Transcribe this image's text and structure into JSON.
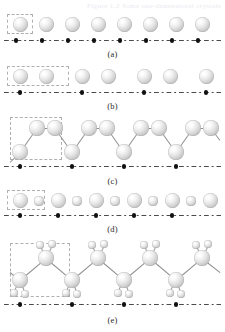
{
  "figure": {
    "cropped_header_text": "Figure 1.2  Some one-dimensional crystals",
    "background_color": "#ffffff",
    "atom_color": "#cfcfcf",
    "bond_color": "#8e8e8e",
    "lattice_line_color": "#4a4a4a",
    "lattice_point_color": "#111111",
    "unit_cell_border_color": "#b0b0b0",
    "width": 225,
    "height": 332
  },
  "panels": [
    {
      "id": "a",
      "label": "(a)",
      "description": "monatomic linear chain of identical spheres",
      "label_y": 49,
      "lattice_y": 40,
      "lattice_x0": 4,
      "lattice_x1": 221,
      "lattice_points_x": [
        16,
        42,
        68,
        94,
        120,
        146,
        172,
        198
      ],
      "unit_cell": {
        "x": 7,
        "y": 14,
        "w": 26,
        "h": 20
      },
      "atoms": [
        {
          "cx": 20,
          "cy": 24,
          "r": 7.5,
          "size": "large"
        },
        {
          "cx": 46,
          "cy": 24,
          "r": 7.5,
          "size": "large"
        },
        {
          "cx": 72,
          "cy": 24,
          "r": 7.5,
          "size": "large"
        },
        {
          "cx": 98,
          "cy": 24,
          "r": 7.5,
          "size": "large"
        },
        {
          "cx": 124,
          "cy": 24,
          "r": 7.5,
          "size": "large"
        },
        {
          "cx": 150,
          "cy": 24,
          "r": 7.5,
          "size": "large"
        },
        {
          "cx": 176,
          "cy": 24,
          "r": 7.5,
          "size": "large"
        },
        {
          "cx": 202,
          "cy": 24,
          "r": 7.5,
          "size": "large"
        }
      ],
      "bonds": []
    },
    {
      "id": "b",
      "label": "(b)",
      "description": "dimerized chain: pairs of spheres, lattice constant doubled",
      "label_y": 101,
      "lattice_y": 92,
      "lattice_x0": 4,
      "lattice_x1": 221,
      "lattice_points_x": [
        20,
        82,
        144,
        206
      ],
      "unit_cell": {
        "x": 7,
        "y": 66,
        "w": 62,
        "h": 20
      },
      "atoms": [
        {
          "cx": 20,
          "cy": 76,
          "r": 7.5,
          "size": "large"
        },
        {
          "cx": 46,
          "cy": 76,
          "r": 7.5,
          "size": "large"
        },
        {
          "cx": 82,
          "cy": 76,
          "r": 7.5,
          "size": "large"
        },
        {
          "cx": 108,
          "cy": 76,
          "r": 7.5,
          "size": "large"
        },
        {
          "cx": 144,
          "cy": 76,
          "r": 7.5,
          "size": "large"
        },
        {
          "cx": 170,
          "cy": 76,
          "r": 7.5,
          "size": "large"
        },
        {
          "cx": 206,
          "cy": 76,
          "r": 7.5,
          "size": "large"
        }
      ],
      "bonds": []
    },
    {
      "id": "c",
      "label": "(c)",
      "description": "zigzag chain of bonded spheres",
      "label_y": 176,
      "lattice_y": 166,
      "lattice_x0": 4,
      "lattice_x1": 221,
      "lattice_points_x": [
        20,
        72,
        124,
        176
      ],
      "unit_cell": {
        "x": 10,
        "y": 117,
        "w": 52,
        "h": 43
      },
      "atoms": [
        {
          "cx": 20,
          "cy": 152,
          "r": 8,
          "size": "large"
        },
        {
          "cx": 37,
          "cy": 128,
          "r": 8,
          "size": "large"
        },
        {
          "cx": 55,
          "cy": 128,
          "r": 8,
          "size": "large"
        },
        {
          "cx": 72,
          "cy": 152,
          "r": 8,
          "size": "large"
        },
        {
          "cx": 89,
          "cy": 128,
          "r": 8,
          "size": "large"
        },
        {
          "cx": 107,
          "cy": 128,
          "r": 8,
          "size": "large"
        },
        {
          "cx": 124,
          "cy": 152,
          "r": 8,
          "size": "large"
        },
        {
          "cx": 141,
          "cy": 128,
          "r": 8,
          "size": "large"
        },
        {
          "cx": 159,
          "cy": 128,
          "r": 8,
          "size": "large"
        },
        {
          "cx": 176,
          "cy": 152,
          "r": 8,
          "size": "large"
        },
        {
          "cx": 193,
          "cy": 128,
          "r": 8,
          "size": "large"
        },
        {
          "cx": 211,
          "cy": 128,
          "r": 8,
          "size": "large"
        }
      ],
      "bonds": [
        {
          "x1": 10,
          "y1": 162,
          "x2": 20,
          "y2": 152
        },
        {
          "x1": 20,
          "y1": 152,
          "x2": 37,
          "y2": 128
        },
        {
          "x1": 37,
          "y1": 128,
          "x2": 55,
          "y2": 128
        },
        {
          "x1": 55,
          "y1": 128,
          "x2": 72,
          "y2": 152
        },
        {
          "x1": 72,
          "y1": 152,
          "x2": 89,
          "y2": 128
        },
        {
          "x1": 89,
          "y1": 128,
          "x2": 107,
          "y2": 128
        },
        {
          "x1": 107,
          "y1": 128,
          "x2": 124,
          "y2": 152
        },
        {
          "x1": 124,
          "y1": 152,
          "x2": 141,
          "y2": 128
        },
        {
          "x1": 141,
          "y1": 128,
          "x2": 159,
          "y2": 128
        },
        {
          "x1": 159,
          "y1": 128,
          "x2": 176,
          "y2": 152
        },
        {
          "x1": 176,
          "y1": 152,
          "x2": 193,
          "y2": 128
        },
        {
          "x1": 193,
          "y1": 128,
          "x2": 211,
          "y2": 128
        },
        {
          "x1": 211,
          "y1": 128,
          "x2": 220,
          "y2": 140
        }
      ]
    },
    {
      "id": "d",
      "label": "(d)",
      "description": "binary chain with alternating large and small atoms",
      "label_y": 224,
      "lattice_y": 215,
      "lattice_x0": 4,
      "lattice_x1": 221,
      "lattice_points_x": [
        20,
        58,
        96,
        134,
        172
      ],
      "unit_cell": {
        "x": 7,
        "y": 190,
        "w": 38,
        "h": 20
      },
      "atoms": [
        {
          "cx": 20,
          "cy": 200,
          "r": 7.5,
          "size": "large"
        },
        {
          "cx": 39,
          "cy": 201,
          "r": 4.6,
          "size": "small"
        },
        {
          "cx": 58,
          "cy": 200,
          "r": 7.5,
          "size": "large"
        },
        {
          "cx": 77,
          "cy": 201,
          "r": 4.6,
          "size": "small"
        },
        {
          "cx": 96,
          "cy": 200,
          "r": 7.5,
          "size": "large"
        },
        {
          "cx": 115,
          "cy": 201,
          "r": 4.6,
          "size": "small"
        },
        {
          "cx": 134,
          "cy": 200,
          "r": 7.5,
          "size": "large"
        },
        {
          "cx": 153,
          "cy": 201,
          "r": 4.6,
          "size": "small"
        },
        {
          "cx": 172,
          "cy": 200,
          "r": 7.5,
          "size": "large"
        },
        {
          "cx": 191,
          "cy": 201,
          "r": 4.6,
          "size": "small"
        },
        {
          "cx": 210,
          "cy": 200,
          "r": 7.5,
          "size": "large"
        }
      ],
      "bonds": []
    },
    {
      "id": "e",
      "label": "(e)",
      "description": "polyethylene-like zigzag chain, each backbone atom carrying two small hydrogen atoms",
      "label_y": 315,
      "lattice_y": 304,
      "lattice_x0": 4,
      "lattice_x1": 221,
      "lattice_points_x": [
        20,
        72,
        124,
        176
      ],
      "unit_cell": {
        "x": 10,
        "y": 243,
        "w": 60,
        "h": 54
      },
      "atoms": [
        {
          "cx": 20,
          "cy": 280,
          "r": 8,
          "size": "large"
        },
        {
          "cx": 46,
          "cy": 258,
          "r": 8,
          "size": "large"
        },
        {
          "cx": 72,
          "cy": 280,
          "r": 8,
          "size": "large"
        },
        {
          "cx": 98,
          "cy": 258,
          "r": 8,
          "size": "large"
        },
        {
          "cx": 124,
          "cy": 280,
          "r": 8,
          "size": "large"
        },
        {
          "cx": 150,
          "cy": 258,
          "r": 8,
          "size": "large"
        },
        {
          "cx": 176,
          "cy": 280,
          "r": 8,
          "size": "large"
        },
        {
          "cx": 202,
          "cy": 258,
          "r": 8,
          "size": "large"
        },
        {
          "cx": 14,
          "cy": 293,
          "r": 4.2,
          "size": "small"
        },
        {
          "cx": 25,
          "cy": 294,
          "r": 4.2,
          "size": "small"
        },
        {
          "cx": 40,
          "cy": 245,
          "r": 4.2,
          "size": "small"
        },
        {
          "cx": 52,
          "cy": 244,
          "r": 4.2,
          "size": "small"
        },
        {
          "cx": 66,
          "cy": 293,
          "r": 4.2,
          "size": "small"
        },
        {
          "cx": 77,
          "cy": 294,
          "r": 4.2,
          "size": "small"
        },
        {
          "cx": 92,
          "cy": 245,
          "r": 4.2,
          "size": "small"
        },
        {
          "cx": 104,
          "cy": 244,
          "r": 4.2,
          "size": "small"
        },
        {
          "cx": 118,
          "cy": 293,
          "r": 4.2,
          "size": "small"
        },
        {
          "cx": 129,
          "cy": 294,
          "r": 4.2,
          "size": "small"
        },
        {
          "cx": 144,
          "cy": 245,
          "r": 4.2,
          "size": "small"
        },
        {
          "cx": 156,
          "cy": 244,
          "r": 4.2,
          "size": "small"
        },
        {
          "cx": 170,
          "cy": 293,
          "r": 4.2,
          "size": "small"
        },
        {
          "cx": 181,
          "cy": 294,
          "r": 4.2,
          "size": "small"
        },
        {
          "cx": 196,
          "cy": 245,
          "r": 4.2,
          "size": "small"
        },
        {
          "cx": 208,
          "cy": 244,
          "r": 4.2,
          "size": "small"
        }
      ],
      "bonds": [
        {
          "x1": 10,
          "y1": 272,
          "x2": 20,
          "y2": 280
        },
        {
          "x1": 20,
          "y1": 280,
          "x2": 46,
          "y2": 258
        },
        {
          "x1": 46,
          "y1": 258,
          "x2": 72,
          "y2": 280
        },
        {
          "x1": 72,
          "y1": 280,
          "x2": 98,
          "y2": 258
        },
        {
          "x1": 98,
          "y1": 258,
          "x2": 124,
          "y2": 280
        },
        {
          "x1": 124,
          "y1": 280,
          "x2": 150,
          "y2": 258
        },
        {
          "x1": 150,
          "y1": 258,
          "x2": 176,
          "y2": 280
        },
        {
          "x1": 176,
          "y1": 280,
          "x2": 202,
          "y2": 258
        },
        {
          "x1": 202,
          "y1": 258,
          "x2": 220,
          "y2": 272
        },
        {
          "x1": 20,
          "y1": 280,
          "x2": 14,
          "y2": 291,
          "thin": true
        },
        {
          "x1": 20,
          "y1": 280,
          "x2": 25,
          "y2": 292,
          "thin": true
        },
        {
          "x1": 46,
          "y1": 258,
          "x2": 41,
          "y2": 247,
          "thin": true
        },
        {
          "x1": 46,
          "y1": 258,
          "x2": 52,
          "y2": 246,
          "thin": true
        },
        {
          "x1": 72,
          "y1": 280,
          "x2": 66,
          "y2": 291,
          "thin": true
        },
        {
          "x1": 72,
          "y1": 280,
          "x2": 77,
          "y2": 292,
          "thin": true
        },
        {
          "x1": 98,
          "y1": 258,
          "x2": 93,
          "y2": 247,
          "thin": true
        },
        {
          "x1": 98,
          "y1": 258,
          "x2": 104,
          "y2": 246,
          "thin": true
        },
        {
          "x1": 124,
          "y1": 280,
          "x2": 118,
          "y2": 291,
          "thin": true
        },
        {
          "x1": 124,
          "y1": 280,
          "x2": 129,
          "y2": 292,
          "thin": true
        },
        {
          "x1": 150,
          "y1": 258,
          "x2": 145,
          "y2": 247,
          "thin": true
        },
        {
          "x1": 150,
          "y1": 258,
          "x2": 156,
          "y2": 246,
          "thin": true
        },
        {
          "x1": 176,
          "y1": 280,
          "x2": 170,
          "y2": 291,
          "thin": true
        },
        {
          "x1": 176,
          "y1": 280,
          "x2": 181,
          "y2": 292,
          "thin": true
        },
        {
          "x1": 202,
          "y1": 258,
          "x2": 197,
          "y2": 247,
          "thin": true
        },
        {
          "x1": 202,
          "y1": 258,
          "x2": 208,
          "y2": 246,
          "thin": true
        }
      ]
    }
  ]
}
